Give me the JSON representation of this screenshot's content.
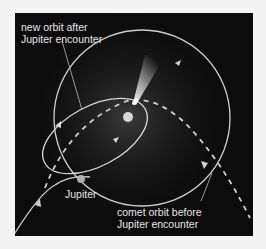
{
  "labels": {
    "new_orbit_line1": "new orbit after",
    "new_orbit_line2": "Jupiter encounter",
    "jupiter": "Jupiter",
    "comet_orbit_line1": "comet orbit before",
    "comet_orbit_line2": "Jupiter encounter"
  },
  "colors": {
    "background": "#0c0c0c",
    "orbit_line": "#d8d8d8",
    "sun": "#d8d8d8",
    "jupiter": "#b0b0b0",
    "page": "#f4f4f4"
  }
}
